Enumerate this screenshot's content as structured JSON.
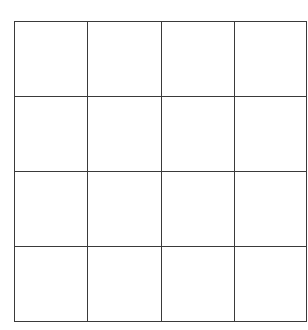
{
  "grid": {
    "rows": 4,
    "columns": 4,
    "line_color": "#3a3a3a",
    "background": "#ffffff",
    "cells": [
      [
        "",
        "",
        "",
        ""
      ],
      [
        "",
        "",
        "",
        ""
      ],
      [
        "",
        "",
        "",
        ""
      ],
      [
        "",
        "",
        "",
        ""
      ]
    ]
  }
}
